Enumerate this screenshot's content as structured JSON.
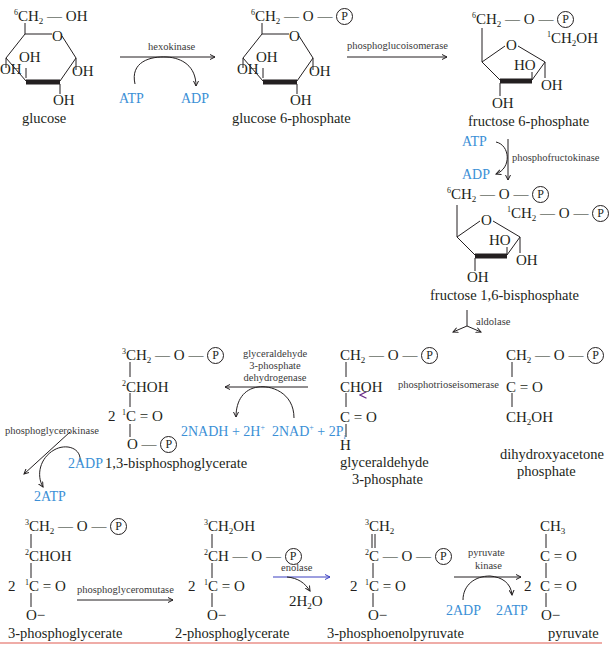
{
  "colors": {
    "cofactor": "#3b8fd6",
    "ink": "#231f20",
    "divider": "#e05a50",
    "isomerase_start": "#6a2d8a",
    "isomerase_end": "#8fdc8f"
  },
  "molecules": {
    "glucose": {
      "name": "glucose",
      "top": "6CH2 — OH",
      "oh": [
        "OH",
        "OH",
        "OH",
        "OH"
      ]
    },
    "g6p": {
      "name": "glucose 6-phosphate",
      "top_group": "6CH2 — O — P",
      "oh": [
        "OH",
        "OH",
        "OH",
        "OH"
      ]
    },
    "f6p": {
      "name": "fructose 6-phosphate",
      "top_group": "6CH2 — O — P",
      "c1": "1CH2OH",
      "oh": [
        "HO",
        "OH",
        "OH"
      ]
    },
    "f16bp": {
      "name": "fructose 1,6-bisphosphate",
      "top_group": "6CH2 — O — P",
      "c1": "1CH2 — O — P",
      "oh": [
        "HO",
        "OH",
        "OH"
      ]
    },
    "gap": {
      "name_line1": "glyceraldehyde",
      "name_line2": "3-phosphate",
      "lines": [
        "CH2 — O — P",
        "CHOH",
        "C = O",
        "H"
      ]
    },
    "dhap": {
      "name_line1": "dihydroxyacetone",
      "name_line2": "phosphate",
      "lines": [
        "CH2 — O — P",
        "C = O",
        "CH2OH"
      ]
    },
    "bpg13": {
      "name": "1,3-bisphosphoglycerate",
      "coef": "2",
      "lines": [
        "3CH2 — O — P",
        "2CHOH",
        "1C = O",
        "O — P"
      ]
    },
    "pg3": {
      "name": "3-phosphoglycerate",
      "coef": "2",
      "lines": [
        "3CH2 — O — P",
        "2CHOH",
        "1C = O",
        "O−"
      ]
    },
    "pg2": {
      "name": "2-phosphoglycerate",
      "coef": "2",
      "lines": [
        "3CH2OH",
        "2CH — O — P",
        "1C = O",
        "O−"
      ]
    },
    "pep": {
      "name": "3-phosphoenolpyruvate",
      "coef": "2",
      "lines": [
        "3CH2",
        "2C — O — P",
        "1C = O",
        "O−"
      ]
    },
    "pyruvate": {
      "name": "pyruvate",
      "coef": "2",
      "lines": [
        "CH3",
        "C = O",
        "C = O",
        "O−"
      ]
    }
  },
  "enzymes": {
    "hexokinase": "hexokinase",
    "phosphoglucoisomerase": "phosphoglucoisomerase",
    "phosphofructokinase": "phosphofructokinase",
    "aldolase": "aldolase",
    "phosphotrioseisomerase": "phosphotrioseisomerase",
    "gapdh": [
      "glyceraldehyde",
      "3-phosphate",
      "dehydrogenase"
    ],
    "phosphoglycerokinase": "phosphoglycerokinase",
    "phosphoglyceromutase": "phosphoglyceromutase",
    "enolase": "enolase",
    "pyruvate_kinase": [
      "pyruvate",
      "kinase"
    ]
  },
  "cofactors": {
    "hk_in": "ATP",
    "hk_out": "ADP",
    "pfk_in": "ATP",
    "pfk_out": "ADP",
    "gapdh_out": "2NADH + 2H+",
    "gapdh_in": "2NAD+ + 2Pi",
    "pgk_in": "2ADP",
    "pgk_out": "2ATP",
    "enolase_out": "2H2O",
    "pk_in": "2ADP",
    "pk_out": "2ATP"
  }
}
